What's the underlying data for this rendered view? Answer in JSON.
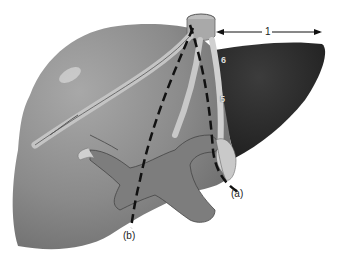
{
  "figure": {
    "labels": {
      "arrow": "1",
      "segment_6": "6",
      "segment_5": "5",
      "line_a": "(a)",
      "line_b": "(b)"
    },
    "colors": {
      "right_lobe": "#8a8a8a",
      "left_lobe": "#2e2e2e",
      "portal_vein": "#7d7d7d",
      "vessels": "#c8c8c8",
      "dashed_line": "#111111"
    }
  }
}
